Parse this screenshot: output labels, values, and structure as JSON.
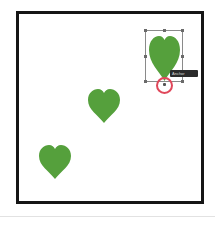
{
  "canvas": {
    "frame_color": "#151515",
    "background": "#ffffff"
  },
  "hearts": [
    {
      "name": "heart-selected",
      "color": "#55a03c",
      "state": "selected"
    },
    {
      "name": "heart-middle",
      "color": "#55a03c",
      "state": "normal"
    },
    {
      "name": "heart-bottom-left",
      "color": "#55a03c",
      "state": "normal"
    }
  ],
  "selection": {
    "border_color": "#8a8a8a",
    "highlight_ring_color": "#e0475a",
    "tooltip": {
      "label": "Anchor"
    }
  }
}
